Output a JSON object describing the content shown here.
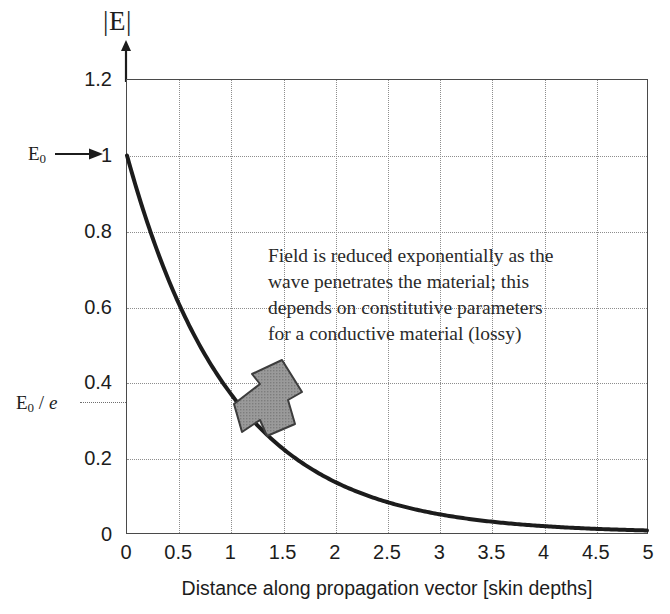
{
  "chart_data": {
    "type": "line",
    "title": "|E|",
    "xlabel": "Distance along propagation vector [skin depths]",
    "ylabel": "|E|",
    "xlim": [
      0,
      5
    ],
    "ylim": [
      0,
      1.2
    ],
    "grid": true,
    "legend": null,
    "xticks": [
      "0",
      "0.5",
      "1",
      "1.5",
      "2",
      "2.5",
      "3",
      "3.5",
      "4",
      "4.5",
      "5"
    ],
    "xtick_values": [
      0,
      0.5,
      1,
      1.5,
      2,
      2.5,
      3,
      3.5,
      4,
      4.5,
      5
    ],
    "yticks": [
      "0",
      "0.2",
      "0.4",
      "0.6",
      "0.8",
      "1",
      "1.2"
    ],
    "ytick_values": [
      0,
      0.2,
      0.4,
      0.6,
      0.8,
      1,
      1.2
    ],
    "series": [
      {
        "name": "exponential decay",
        "formula": "exp(-x)",
        "color": "#1c1c1c",
        "linewidth": 4,
        "x": [
          0,
          0.25,
          0.5,
          0.75,
          1,
          1.25,
          1.5,
          1.75,
          2,
          2.25,
          2.5,
          2.75,
          3,
          3.25,
          3.5,
          3.75,
          4,
          4.25,
          4.5,
          4.75,
          5
        ],
        "values": [
          1,
          0.779,
          0.607,
          0.472,
          0.368,
          0.287,
          0.223,
          0.174,
          0.135,
          0.105,
          0.082,
          0.064,
          0.05,
          0.039,
          0.03,
          0.024,
          0.018,
          0.014,
          0.011,
          0.009,
          0.007
        ]
      }
    ],
    "annotations": [
      {
        "name": "E0-marker",
        "text": "E0",
        "text_sub": "0",
        "points_to_y": 1,
        "arrow": "right"
      },
      {
        "name": "E0-over-e-marker",
        "text": "E0 / e",
        "points_to_y": 0.368,
        "guide_line": "dotted-horizontal"
      },
      {
        "name": "note",
        "lines": [
          "Field is reduced exponentially as the",
          "wave penetrates the material; this",
          "depends on constitutive parameters",
          "for a conductive material (lossy)"
        ]
      },
      {
        "name": "block-arrow",
        "points_to": [
          1.15,
          0.33
        ],
        "direction": "down-left",
        "fill": "#8c8c8c"
      }
    ]
  },
  "labels": {
    "y_axis_title_main": "E",
    "y_axis_title_full": "|E|",
    "e0_base": "E",
    "e0_sub": "0",
    "e0_over_e_base": "E",
    "e0_over_e_sub": "0",
    "e0_over_e_slash": " / ",
    "e0_over_e_ital": "e",
    "x_axis_label": "Distance along propagation vector [skin depths]",
    "note_line_1": "Field is reduced exponentially as the",
    "note_line_2": "wave penetrates the material; this",
    "note_line_3": "depends on constitutive parameters",
    "note_line_4": "for a conductive material (lossy)"
  },
  "colors": {
    "curve": "#1c1c1c",
    "frame": "#4a4a4a",
    "grid": "#8d8d8d",
    "arrow_fill": "#8c8c8c",
    "arrow_stroke": "#3a3a3a",
    "background": "#ffffff",
    "text": "#1c1c1c"
  }
}
